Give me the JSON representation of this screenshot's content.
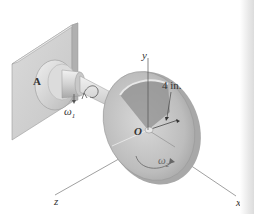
{
  "figure": {
    "labels": {
      "support": "A",
      "axis_y": "y",
      "axis_z": "z",
      "axis_x": "x",
      "origin": "O",
      "dimension": "4 in.",
      "omega_shaft": "ω",
      "omega_shaft_sub": "1",
      "omega_disk": "ω",
      "omega_disk_sub": "2"
    },
    "colors": {
      "plate_face": "#d4d4d4",
      "plate_edge": "#b9b9b9",
      "metal_light": "#e6e6e6",
      "metal_mid": "#c4c4c4",
      "metal_dark": "#9a9a9a",
      "axis_line": "#555555"
    }
  }
}
